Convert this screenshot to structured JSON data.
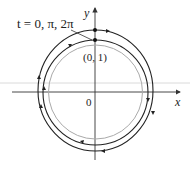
{
  "figure": {
    "label_t": "t = 0, π, 2π",
    "label_point": "(0, 1)",
    "label_origin": "0",
    "axis_x": "x",
    "axis_y": "y"
  },
  "colors": {
    "curve": "#222222",
    "unit_circle": "#aaaaaa",
    "axis": "#333333",
    "guide_line": "#cccccc"
  },
  "geometry": {
    "center": [
      95,
      92
    ],
    "outer_radius": 58,
    "middle_radius": 52,
    "unit_radius": 47,
    "direction": "clockwise"
  }
}
